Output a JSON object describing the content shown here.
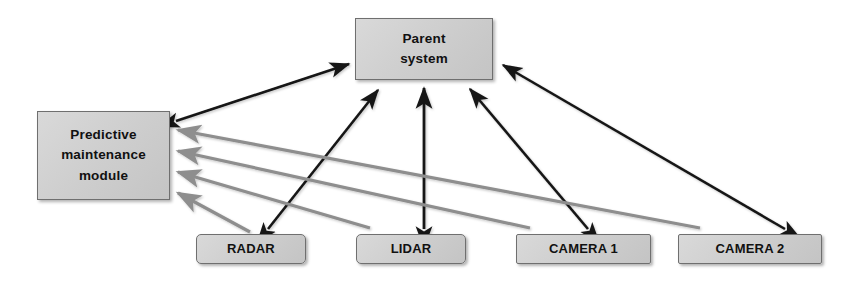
{
  "diagram": {
    "type": "block-diagram",
    "background_color": "#ffffff",
    "node_fill_color": "#cfcfcf",
    "node_border_color": "#6f6f6f",
    "bidirectional_edge_color": "#151515",
    "sensor_to_module_edge_color": "#8e8e8e",
    "nodes": {
      "parent_system": {
        "label": "Parent\nsystem"
      },
      "predictive_maintenance_module": {
        "label": "Predictive\nmaintenance\nmodule"
      },
      "radar": {
        "label": "RADAR"
      },
      "lidar": {
        "label": "LIDAR"
      },
      "camera_1": {
        "label": "CAMERA 1"
      },
      "camera_2": {
        "label": "CAMERA 2"
      }
    },
    "edges": [
      {
        "from": "predictive_maintenance_module",
        "to": "parent_system",
        "style": "bidirectional",
        "color": "#151515"
      },
      {
        "from": "radar",
        "to": "parent_system",
        "style": "bidirectional",
        "color": "#151515"
      },
      {
        "from": "lidar",
        "to": "parent_system",
        "style": "bidirectional",
        "color": "#151515"
      },
      {
        "from": "camera_1",
        "to": "parent_system",
        "style": "bidirectional",
        "color": "#151515"
      },
      {
        "from": "camera_2",
        "to": "parent_system",
        "style": "bidirectional",
        "color": "#151515"
      },
      {
        "from": "radar",
        "to": "predictive_maintenance_module",
        "style": "unidirectional",
        "color": "#8e8e8e"
      },
      {
        "from": "lidar",
        "to": "predictive_maintenance_module",
        "style": "unidirectional",
        "color": "#8e8e8e"
      },
      {
        "from": "camera_1",
        "to": "predictive_maintenance_module",
        "style": "unidirectional",
        "color": "#8e8e8e"
      },
      {
        "from": "camera_2",
        "to": "predictive_maintenance_module",
        "style": "unidirectional",
        "color": "#8e8e8e"
      }
    ]
  }
}
